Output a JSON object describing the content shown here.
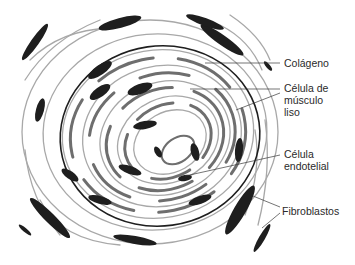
{
  "figure": {
    "colors": {
      "dark": "#1e1e1e",
      "mid": "#6e6e6e",
      "light": "#a8a8a8",
      "background": "#ffffff"
    }
  },
  "labels": [
    {
      "id": "colageno",
      "text": "Colágeno",
      "x": 284,
      "y": 56
    },
    {
      "id": "musculo",
      "text": "Célula de\nmúsculo\nliso",
      "x": 284,
      "y": 82
    },
    {
      "id": "endotelial",
      "text": "Célula\nendotelial",
      "x": 284,
      "y": 148
    },
    {
      "id": "fibroblastos",
      "text": "Fibroblastos",
      "x": 282,
      "y": 204
    }
  ]
}
